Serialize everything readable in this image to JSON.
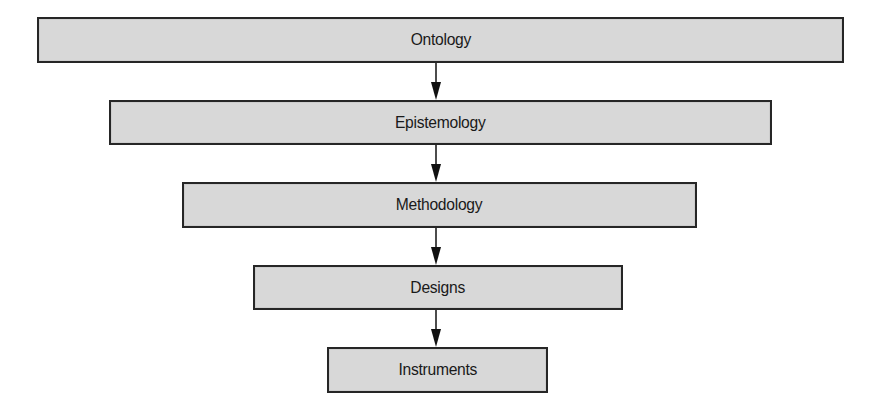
{
  "diagram": {
    "type": "hierarchy-flow",
    "direction": "top-to-bottom",
    "colors": {
      "box_fill": "#d8d8d8",
      "box_border": "#262626",
      "arrow": "#111111",
      "text": "#1a1a1a",
      "background": "#ffffff"
    },
    "nodes": [
      {
        "id": "ontology",
        "label": "Ontology"
      },
      {
        "id": "epistemology",
        "label": "Epistemology"
      },
      {
        "id": "methodology",
        "label": "Methodology"
      },
      {
        "id": "designs",
        "label": "Designs"
      },
      {
        "id": "instruments",
        "label": "Instruments"
      }
    ],
    "edges": [
      {
        "from": "ontology",
        "to": "epistemology"
      },
      {
        "from": "epistemology",
        "to": "methodology"
      },
      {
        "from": "methodology",
        "to": "designs"
      },
      {
        "from": "designs",
        "to": "instruments"
      }
    ]
  }
}
